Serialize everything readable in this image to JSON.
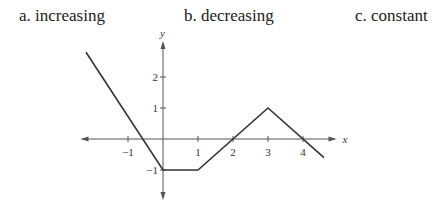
{
  "options": {
    "a": "a.  increasing",
    "b": "b. decreasing",
    "c": "c. constant"
  },
  "chart_data": {
    "type": "line",
    "title": "",
    "xlabel": "x",
    "ylabel": "y",
    "x": [
      -2.2,
      0,
      1,
      3,
      4.6
    ],
    "y": [
      2.8,
      -1,
      -1,
      1,
      -0.6
    ],
    "xlim": [
      -2.3,
      4.9
    ],
    "ylim": [
      -1.9,
      3.1
    ],
    "x_ticks": [
      -1,
      1,
      2,
      3,
      4
    ],
    "y_ticks": [
      -1,
      1,
      2
    ],
    "x_tick_labels": [
      "−1",
      "1",
      "2",
      "3",
      "4"
    ],
    "y_tick_labels": [
      "−1",
      "1",
      "2"
    ],
    "grid": false,
    "legend": null
  }
}
